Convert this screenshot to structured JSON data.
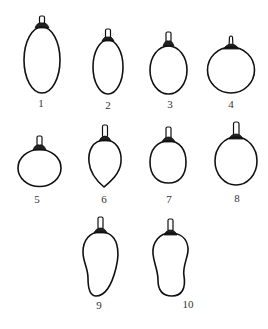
{
  "figure": {
    "stroke_color": "#111111",
    "background": "#ffffff"
  },
  "shapes": [
    {
      "id": 1,
      "label": "1",
      "shape": "long-elliptical"
    },
    {
      "id": 2,
      "label": "2",
      "shape": "elliptical"
    },
    {
      "id": 3,
      "label": "3",
      "shape": "oval"
    },
    {
      "id": 4,
      "label": "4",
      "shape": "round"
    },
    {
      "id": 5,
      "label": "5",
      "shape": "flattened-round"
    },
    {
      "id": 6,
      "label": "6",
      "shape": "obovate"
    },
    {
      "id": 7,
      "label": "7",
      "shape": "ovate"
    },
    {
      "id": 8,
      "label": "8",
      "shape": "broad-oval"
    },
    {
      "id": 9,
      "label": "9",
      "shape": "curved-elongated"
    },
    {
      "id": 10,
      "label": "10",
      "shape": "curved-elongated"
    }
  ]
}
